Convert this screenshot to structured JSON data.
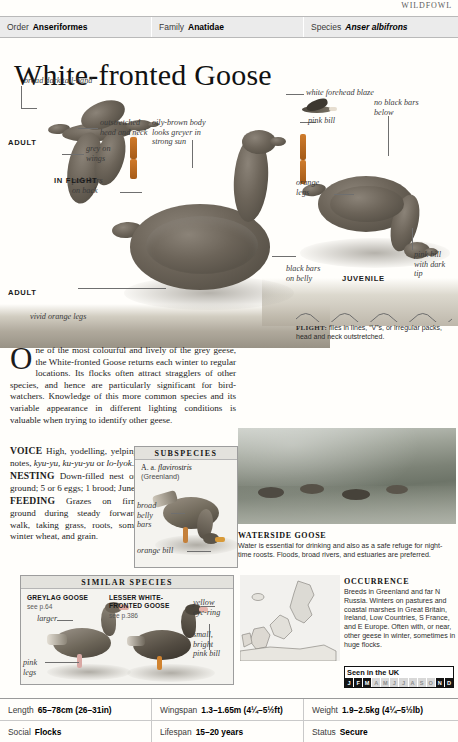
{
  "running_head": "WILDFOWL",
  "taxonomy": [
    {
      "key": "Order",
      "value": "Anseriformes",
      "italic": false
    },
    {
      "key": "Family",
      "value": "Anatidae",
      "italic": false
    },
    {
      "key": "Species",
      "value": "Anser albifrons",
      "italic": true
    }
  ],
  "title": "White-fronted Goose",
  "plate": {
    "annotations": [
      {
        "id": "broad-dark-tail-band",
        "text": "broad dark tail-band"
      },
      {
        "id": "outstretched-head-neck",
        "text": "outstretched\nhead and neck"
      },
      {
        "id": "grey-on-wings",
        "text": "grey on\nwings"
      },
      {
        "id": "pale-bars-on-back",
        "text": "pale bars\non back"
      },
      {
        "id": "oily-brown-body",
        "text": "oily-brown body\nlooks greyer in\nstrong sun"
      },
      {
        "id": "black-bars-on-belly",
        "text": "black bars\non belly"
      },
      {
        "id": "vivid-orange-legs",
        "text": "vivid orange legs"
      },
      {
        "id": "white-forehead-blaze",
        "text": "white forehead blaze"
      },
      {
        "id": "pink-bill",
        "text": "pink bill"
      },
      {
        "id": "no-black-bars-below",
        "text": "no black bars\nbelow"
      },
      {
        "id": "orange-legs",
        "text": "orange\nlegs"
      },
      {
        "id": "pink-bill-dark-tip",
        "text": "pink bill\nwith dark\ntip"
      }
    ],
    "captions": [
      {
        "id": "adult-flight",
        "text": "ADULT"
      },
      {
        "id": "in-flight",
        "text": "IN FLIGHT"
      },
      {
        "id": "adult",
        "text": "ADULT"
      },
      {
        "id": "juvenile",
        "text": "JUVENILE"
      }
    ],
    "flight_caption_label": "FLIGHT:",
    "flight_caption_text": " flies in lines, “V”s, or irregular packs, head and neck outstretched."
  },
  "description": {
    "dropcap": "O",
    "paragraph": "ne of the most colourful and lively of the grey geese, the White-fronted Goose returns each winter to regular locations. Its flocks often attract stragglers of other species, and hence are particularly significant for bird-watchers. Knowledge of this more common species and its variable appearance in different lighting conditions is valuable when trying to identify other geese.",
    "sections": [
      {
        "label": "VOICE",
        "text": "High, yodelling, yelping notes, ",
        "italic_note": "kyu-yu, ku-yu-yu",
        "tail": " or ",
        "italic_note2": "lo-lyok",
        "end": "."
      },
      {
        "label": "NESTING",
        "text": "Down-filled nest on ground; 5 or 6 eggs; 1 brood; June."
      },
      {
        "label": "FEEDING",
        "text": "Grazes on firm ground during steady forward walk, taking grass, roots, some winter wheat, and grain."
      }
    ]
  },
  "subspecies_panel": {
    "heading": "SUBSPECIES",
    "name_prefix": "A. a. ",
    "name_italic": "flavirostris",
    "region": "(Greenland)",
    "annotations": [
      {
        "id": "broad-belly-bars",
        "text": "broad\nbelly\nbars"
      },
      {
        "id": "orange-bill",
        "text": "orange bill"
      }
    ]
  },
  "similar_species_panel": {
    "heading": "SIMILAR SPECIES",
    "species": [
      {
        "name": "GREYLAG GOOSE",
        "page": "see p.64",
        "annotations": [
          {
            "id": "larger",
            "text": "larger"
          },
          {
            "id": "pink-legs",
            "text": "pink\nlegs"
          }
        ]
      },
      {
        "name": "LESSER WHITE-\nFRONTED GOOSE",
        "page": "see p.386",
        "annotations": [
          {
            "id": "yellow-eye-ring",
            "text": "yellow\neye-ring"
          },
          {
            "id": "small-bright-pink-bill",
            "text": "small,\nbright\npink bill"
          }
        ]
      }
    ]
  },
  "waterside": {
    "title": "WATERSIDE GOOSE",
    "text": "Water is essential for drinking and also as a safe refuge for night-time roosts. Floods, broad rivers, and estuaries are preferred."
  },
  "occurrence": {
    "title": "OCCURRENCE",
    "text": "Breeds in Greenland and far N Russia. Winters on pastures and coastal marshes in Great Britain, Ireland, Low Countries, S France, and E Europe. Often with, or near, other geese in winter, sometimes in huge flocks."
  },
  "seen_in_uk": {
    "label": "Seen in the UK",
    "months": [
      {
        "letter": "J",
        "active": true
      },
      {
        "letter": "F",
        "active": true
      },
      {
        "letter": "M",
        "active": true
      },
      {
        "letter": "A",
        "active": false
      },
      {
        "letter": "M",
        "active": false
      },
      {
        "letter": "J",
        "active": false
      },
      {
        "letter": "J",
        "active": false
      },
      {
        "letter": "A",
        "active": false
      },
      {
        "letter": "S",
        "active": false
      },
      {
        "letter": "O",
        "active": false
      },
      {
        "letter": "N",
        "active": true
      },
      {
        "letter": "D",
        "active": true
      }
    ]
  },
  "stats": [
    [
      {
        "key": "Length",
        "value": "65–78cm (26–31in)"
      },
      {
        "key": "Wingspan",
        "value": "1.3–1.65m (4¼–5½ft)"
      },
      {
        "key": "Weight",
        "value": "1.9–2.5kg (4¼–5½lb)"
      }
    ],
    [
      {
        "key": "Social",
        "value": "Flocks"
      },
      {
        "key": "Lifespan",
        "value": "15–20 years"
      },
      {
        "key": "Status",
        "value": "Secure"
      }
    ]
  ]
}
